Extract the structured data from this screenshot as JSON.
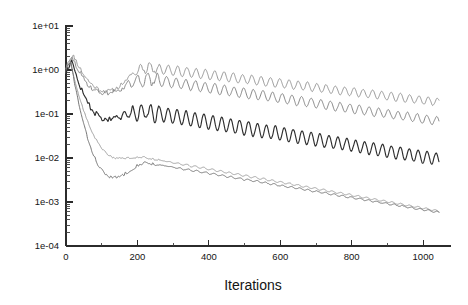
{
  "chart_data": {
    "type": "line",
    "title": "",
    "subtitle": "",
    "xlabel": "Iterations",
    "ylabel": "",
    "yscale": "log",
    "xscale": "linear",
    "xlim": [
      0,
      1050
    ],
    "ylim": [
      0.0001,
      10
    ],
    "grid": false,
    "legend": "none",
    "xticks": [
      0,
      200,
      400,
      600,
      800,
      1000
    ],
    "xticklabels": [
      "0",
      "200",
      "400",
      "600",
      "800",
      "1000"
    ],
    "yticks": [
      10,
      1,
      0.1,
      0.01,
      0.001,
      0.0001
    ],
    "yticklabels": [
      "1e+01",
      "1e+00",
      "1e-01",
      "1e-02",
      "1e-03",
      "1e-04"
    ],
    "minor_ticks": true,
    "series": [
      {
        "name": "series-1-upper-gray",
        "color": "#8c8c8c",
        "width": 0.9,
        "start_value": 0.9,
        "peak_value": 2.1,
        "peak_x": 22,
        "dip_value": 0.33,
        "dip_x": 118,
        "plateau_value": 1.15,
        "plateau_x": 225,
        "end_value": 0.185,
        "osc_amp_log": 0.115,
        "osc_period": 26,
        "osc_start": 150,
        "noise": 0.05,
        "seed": 11
      },
      {
        "name": "series-2-mid-gray",
        "color": "#7a7a7a",
        "width": 0.9,
        "start_value": 1.0,
        "peak_value": 1.9,
        "peak_x": 18,
        "dip_value": 0.3,
        "dip_x": 110,
        "plateau_value": 0.62,
        "plateau_x": 230,
        "end_value": 0.068,
        "osc_amp_log": 0.125,
        "osc_period": 27,
        "osc_start": 140,
        "noise": 0.055,
        "seed": 29
      },
      {
        "name": "series-3-dark",
        "color": "#2e2e2e",
        "width": 1.15,
        "start_value": 0.8,
        "peak_value": 1.6,
        "peak_x": 16,
        "dip_value": 0.075,
        "dip_x": 120,
        "plateau_value": 0.115,
        "plateau_x": 215,
        "end_value": 0.0092,
        "osc_amp_log": 0.175,
        "osc_period": 25,
        "osc_start": 130,
        "noise": 0.06,
        "seed": 47
      },
      {
        "name": "series-4-light-gray",
        "color": "#9a9a9a",
        "width": 0.95,
        "start_value": 1.1,
        "peak_value": 1.5,
        "peak_x": 12,
        "dip_value": 0.0098,
        "dip_x": 150,
        "plateau_value": 0.0105,
        "plateau_x": 215,
        "end_value": 0.00062,
        "osc_amp_log": 0.022,
        "osc_period": 24,
        "osc_start": 260,
        "noise": 0.02,
        "seed": 63
      },
      {
        "name": "series-5-medium-gray",
        "color": "#6e6e6e",
        "width": 0.95,
        "start_value": 1.05,
        "peak_value": 1.45,
        "peak_x": 14,
        "dip_value": 0.0036,
        "dip_x": 135,
        "plateau_value": 0.0078,
        "plateau_x": 225,
        "end_value": 0.00058,
        "osc_amp_log": 0.02,
        "osc_period": 24,
        "osc_start": 265,
        "noise": 0.035,
        "seed": 83
      }
    ]
  },
  "axes": {
    "plot_left_px": 66,
    "plot_right_px": 441,
    "plot_top_px": 26,
    "plot_bottom_px": 246,
    "axis_color": "#2b2b2b",
    "background": "#ffffff"
  }
}
